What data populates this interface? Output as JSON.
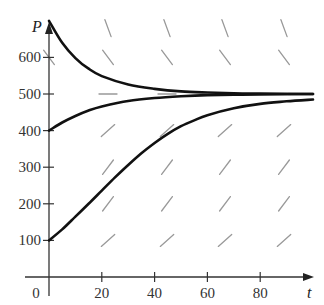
{
  "chart_data": {
    "type": "line",
    "title": "",
    "xlabel": "t",
    "ylabel": "P",
    "xlim": [
      0,
      100
    ],
    "ylim": [
      0,
      700
    ],
    "grid": false,
    "legend": null,
    "x_ticks": [
      0,
      20,
      40,
      60,
      80
    ],
    "y_ticks": [
      100,
      200,
      300,
      400,
      500,
      600
    ],
    "x_tick_labels": [
      "0",
      "20",
      "40",
      "60",
      "80"
    ],
    "y_tick_labels": [
      "100",
      "200",
      "300",
      "400",
      "500",
      "600"
    ],
    "equilibrium": 500,
    "slope_field": {
      "t": [
        0,
        22,
        44,
        66,
        88
      ],
      "P": [
        100,
        200,
        300,
        400,
        500,
        600,
        675
      ],
      "description": "Direction field of a logistic equation: positive slopes below P=500, zero at P=500, negative above"
    },
    "series": [
      {
        "name": "solution P(0)=700",
        "points": [
          [
            0,
            700
          ],
          [
            5,
            640
          ],
          [
            10,
            598
          ],
          [
            15,
            569
          ],
          [
            20,
            549
          ],
          [
            30,
            526
          ],
          [
            40,
            514
          ],
          [
            50,
            507
          ],
          [
            60,
            504
          ],
          [
            70,
            502
          ],
          [
            80,
            501
          ],
          [
            100,
            500
          ]
        ]
      },
      {
        "name": "solution P(0)=400",
        "points": [
          [
            0,
            400
          ],
          [
            5,
            422
          ],
          [
            10,
            440
          ],
          [
            15,
            455
          ],
          [
            20,
            466
          ],
          [
            30,
            481
          ],
          [
            40,
            489
          ],
          [
            50,
            494
          ],
          [
            60,
            497
          ],
          [
            70,
            498
          ],
          [
            80,
            499
          ],
          [
            100,
            500
          ]
        ]
      },
      {
        "name": "solution P(0)=100",
        "points": [
          [
            0,
            100
          ],
          [
            5,
            130
          ],
          [
            10,
            165
          ],
          [
            15,
            200
          ],
          [
            20,
            236
          ],
          [
            25,
            272
          ],
          [
            30,
            306
          ],
          [
            35,
            338
          ],
          [
            40,
            366
          ],
          [
            45,
            391
          ],
          [
            50,
            412
          ],
          [
            55,
            428
          ],
          [
            60,
            442
          ],
          [
            70,
            461
          ],
          [
            80,
            473
          ],
          [
            90,
            480
          ],
          [
            100,
            485
          ]
        ]
      }
    ]
  },
  "colors": {
    "curve": "#111111",
    "axis": "#333333",
    "slope": "#999999"
  }
}
